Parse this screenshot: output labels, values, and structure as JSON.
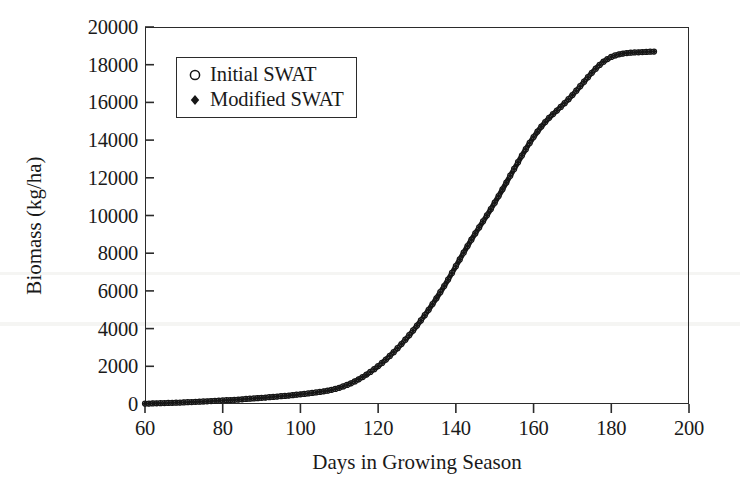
{
  "chart_data": {
    "type": "line",
    "title": "",
    "xlabel": "Days in Growing Season",
    "ylabel": "Biomass (kg/ha)",
    "xlim": [
      60,
      200
    ],
    "ylim": [
      0,
      20000
    ],
    "xticks": [
      "60",
      "80",
      "100",
      "120",
      "140",
      "160",
      "180",
      "200"
    ],
    "yticks": [
      "0",
      "2000",
      "4000",
      "6000",
      "8000",
      "10000",
      "12000",
      "14000",
      "16000",
      "18000",
      "20000"
    ],
    "grid": false,
    "legend_position": "upper-left-inside",
    "marker_colors": {
      "line": "#161616",
      "frame": "#2b2b2b"
    },
    "x": [
      60,
      61,
      62,
      63,
      64,
      65,
      66,
      67,
      68,
      69,
      70,
      71,
      72,
      73,
      74,
      75,
      76,
      77,
      78,
      79,
      80,
      81,
      82,
      83,
      84,
      85,
      86,
      87,
      88,
      89,
      90,
      91,
      92,
      93,
      94,
      95,
      96,
      97,
      98,
      99,
      100,
      101,
      102,
      103,
      104,
      105,
      106,
      107,
      108,
      109,
      110,
      111,
      112,
      113,
      114,
      115,
      116,
      117,
      118,
      119,
      120,
      121,
      122,
      123,
      124,
      125,
      126,
      127,
      128,
      129,
      130,
      131,
      132,
      133,
      134,
      135,
      136,
      137,
      138,
      139,
      140,
      141,
      142,
      143,
      144,
      145,
      146,
      147,
      148,
      149,
      150,
      151,
      152,
      153,
      154,
      155,
      156,
      157,
      158,
      159,
      160,
      161,
      162,
      163,
      164,
      165,
      166,
      167,
      168,
      169,
      170,
      171,
      172,
      173,
      174,
      175,
      176,
      177,
      178,
      179,
      180,
      181,
      182,
      183,
      184,
      185,
      186,
      187,
      188,
      189,
      190,
      191
    ],
    "series": [
      {
        "name": "Initial SWAT",
        "marker": "open-circle",
        "values": [
          20,
          25,
          30,
          36,
          42,
          48,
          55,
          62,
          70,
          78,
          86,
          95,
          104,
          113,
          123,
          133,
          143,
          154,
          165,
          176,
          188,
          200,
          212,
          225,
          238,
          252,
          266,
          280,
          295,
          310,
          326,
          342,
          359,
          376,
          394,
          412,
          431,
          450,
          470,
          491,
          513,
          536,
          560,
          585,
          612,
          640,
          672,
          708,
          750,
          800,
          860,
          930,
          1010,
          1100,
          1200,
          1310,
          1430,
          1560,
          1700,
          1850,
          2010,
          2180,
          2360,
          2550,
          2750,
          2960,
          3180,
          3410,
          3650,
          3900,
          4160,
          4430,
          4710,
          5000,
          5300,
          5610,
          5930,
          6260,
          6600,
          6950,
          7310,
          7670,
          8030,
          8380,
          8720,
          9050,
          9370,
          9690,
          10010,
          10340,
          10680,
          11030,
          11390,
          11750,
          12110,
          12470,
          12830,
          13180,
          13520,
          13850,
          14160,
          14450,
          14720,
          14960,
          15180,
          15380,
          15570,
          15760,
          15960,
          16170,
          16390,
          16620,
          16860,
          17100,
          17340,
          17570,
          17790,
          17990,
          18160,
          18300,
          18410,
          18490,
          18550,
          18590,
          18620,
          18640,
          18650,
          18660,
          18670,
          18680,
          18690,
          18700
        ]
      },
      {
        "name": "Modified SWAT",
        "marker": "filled-diamond",
        "values": [
          18,
          23,
          28,
          34,
          40,
          46,
          53,
          60,
          68,
          76,
          84,
          93,
          102,
          111,
          121,
          131,
          141,
          152,
          163,
          174,
          186,
          198,
          210,
          223,
          236,
          250,
          264,
          278,
          293,
          308,
          324,
          340,
          357,
          374,
          392,
          410,
          429,
          448,
          468,
          489,
          511,
          534,
          558,
          583,
          610,
          638,
          670,
          706,
          748,
          798,
          858,
          928,
          1008,
          1098,
          1198,
          1308,
          1428,
          1558,
          1698,
          1848,
          2008,
          2178,
          2358,
          2548,
          2748,
          2958,
          3178,
          3408,
          3648,
          3898,
          4158,
          4428,
          4708,
          4998,
          5298,
          5608,
          5928,
          6258,
          6598,
          6948,
          7308,
          7668,
          8028,
          8378,
          8718,
          9048,
          9368,
          9688,
          10008,
          10338,
          10678,
          11028,
          11388,
          11748,
          12108,
          12468,
          12828,
          13178,
          13518,
          13848,
          14158,
          14448,
          14718,
          14958,
          15178,
          15378,
          15568,
          15758,
          15958,
          16168,
          16388,
          16618,
          16858,
          17098,
          17338,
          17568,
          17788,
          17988,
          18158,
          18298,
          18408,
          18488,
          18548,
          18588,
          18618,
          18638,
          18648,
          18658,
          18668,
          18678,
          18688,
          18698
        ]
      }
    ]
  },
  "legend": {
    "items": [
      {
        "label": "Initial SWAT",
        "marker": "open-circle"
      },
      {
        "label": "Modified SWAT",
        "marker": "filled-diamond"
      }
    ]
  }
}
